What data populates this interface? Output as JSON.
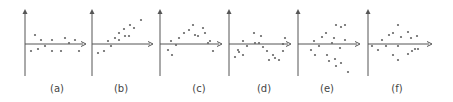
{
  "chart_data": [
    {
      "type": "scatter",
      "title": "(a)",
      "label": "(a)",
      "label_x": 57,
      "axes": {
        "y_x": 25,
        "y_top": 9,
        "y_bottom": 76,
        "x_y": 44,
        "x_left": 25,
        "x_right": 86
      },
      "points": [
        [
          31,
          51
        ],
        [
          35,
          35
        ],
        [
          38,
          49
        ],
        [
          41,
          40
        ],
        [
          45,
          46
        ],
        [
          52,
          40
        ],
        [
          52,
          51
        ],
        [
          61,
          51
        ],
        [
          65,
          38
        ],
        [
          69,
          43
        ],
        [
          75,
          40
        ],
        [
          79,
          51
        ]
      ],
      "grid": false,
      "legend": null
    },
    {
      "type": "scatter",
      "title": "(b)",
      "label": "(b)",
      "label_x": 121,
      "axes": {
        "y_x": 92,
        "y_top": 9,
        "y_bottom": 76,
        "x_y": 44,
        "x_left": 92,
        "x_right": 153
      },
      "points": [
        [
          98,
          53
        ],
        [
          104,
          51
        ],
        [
          108,
          41
        ],
        [
          111,
          46
        ],
        [
          115,
          38
        ],
        [
          119,
          40
        ],
        [
          119,
          33
        ],
        [
          124,
          29
        ],
        [
          125,
          36
        ],
        [
          129,
          36
        ],
        [
          130,
          25
        ],
        [
          134,
          28
        ],
        [
          141,
          20
        ]
      ],
      "grid": false,
      "legend": null
    },
    {
      "type": "scatter",
      "title": "(c)",
      "label": "(c)",
      "label_x": 199,
      "axes": {
        "y_x": 160,
        "y_top": 9,
        "y_bottom": 76,
        "x_y": 44,
        "x_left": 160,
        "x_right": 222
      },
      "points": [
        [
          168,
          50
        ],
        [
          171,
          41
        ],
        [
          172,
          55
        ],
        [
          176,
          45
        ],
        [
          179,
          38
        ],
        [
          184,
          33
        ],
        [
          189,
          30
        ],
        [
          193,
          25
        ],
        [
          195,
          35
        ],
        [
          198,
          36
        ],
        [
          203,
          28
        ],
        [
          205,
          33
        ],
        [
          208,
          43
        ],
        [
          210,
          41
        ],
        [
          213,
          51
        ]
      ],
      "grid": false,
      "legend": null
    },
    {
      "type": "scatter",
      "title": "(d)",
      "label": "(d)",
      "label_x": 264,
      "axes": {
        "y_x": 229,
        "y_top": 9,
        "y_bottom": 76,
        "x_y": 44,
        "x_left": 229,
        "x_right": 291
      },
      "points": [
        [
          235,
          57
        ],
        [
          238,
          50
        ],
        [
          239,
          52
        ],
        [
          243,
          41
        ],
        [
          243,
          55
        ],
        [
          247,
          46
        ],
        [
          254,
          33
        ],
        [
          255,
          43
        ],
        [
          259,
          43
        ],
        [
          261,
          36
        ],
        [
          263,
          47
        ],
        [
          267,
          51
        ],
        [
          269,
          60
        ],
        [
          273,
          55
        ],
        [
          275,
          58
        ],
        [
          279,
          60
        ],
        [
          283,
          44
        ],
        [
          283,
          51
        ],
        [
          285,
          38
        ]
      ],
      "grid": false,
      "legend": null
    },
    {
      "type": "scatter",
      "title": "(e)",
      "label": "(e)",
      "label_x": 327,
      "axes": {
        "y_x": 298,
        "y_top": 9,
        "y_bottom": 76,
        "x_y": 44,
        "x_left": 298,
        "x_right": 360
      },
      "points": [
        [
          311,
          50
        ],
        [
          314,
          41
        ],
        [
          315,
          55
        ],
        [
          319,
          46
        ],
        [
          322,
          37
        ],
        [
          326,
          33
        ],
        [
          327,
          55
        ],
        [
          329,
          61
        ],
        [
          332,
          43
        ],
        [
          334,
          38
        ],
        [
          335,
          59
        ],
        [
          336,
          25
        ],
        [
          336,
          66
        ],
        [
          340,
          48
        ],
        [
          341,
          27
        ],
        [
          341,
          63
        ],
        [
          345,
          25
        ],
        [
          345,
          40
        ],
        [
          348,
          72
        ]
      ],
      "grid": false,
      "legend": null
    },
    {
      "type": "scatter",
      "title": "(f)",
      "label": "(f)",
      "label_x": 397,
      "axes": {
        "y_x": 368,
        "y_top": 9,
        "y_bottom": 76,
        "x_y": 44,
        "x_left": 368,
        "x_right": 432
      },
      "points": [
        [
          372,
          46
        ],
        [
          378,
          50
        ],
        [
          382,
          40
        ],
        [
          386,
          46
        ],
        [
          389,
          35
        ],
        [
          393,
          33
        ],
        [
          393,
          55
        ],
        [
          398,
          46
        ],
        [
          398,
          25
        ],
        [
          398,
          60
        ],
        [
          401,
          37
        ],
        [
          408,
          32
        ],
        [
          408,
          54
        ],
        [
          411,
          38
        ],
        [
          412,
          51
        ],
        [
          415,
          49
        ],
        [
          417,
          36
        ],
        [
          418,
          49
        ]
      ],
      "grid": false,
      "legend": null
    }
  ],
  "style": {
    "axis_color": "#555555",
    "point_color": "#666666",
    "background": "#ffffff"
  }
}
